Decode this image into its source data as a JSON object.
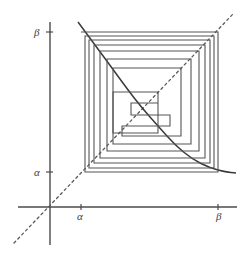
{
  "figure": {
    "type": "cobweb-plot",
    "labels": {
      "y_axis_upper": "β",
      "y_axis_lower": "α",
      "x_axis_lower": "α",
      "x_axis_upper": "β"
    },
    "colors": {
      "axis": "#4b4b4b",
      "curve": "#3a3a3a",
      "identity": "#5a5a5a",
      "cobweb": "#555555",
      "background": "#ffffff"
    }
  },
  "chart_data": {
    "type": "line",
    "title": "",
    "subtitle": "",
    "xlabel": "",
    "ylabel": "",
    "grid": false,
    "legend": "none",
    "xtick_labels": [
      "α",
      "β"
    ],
    "ytick_labels": [
      "α",
      "β"
    ],
    "xticks": [
      81,
      218
    ],
    "yticks": [
      172,
      32
    ],
    "xlim": [
      50,
      237
    ],
    "ylim": [
      207,
      22
    ],
    "origin": {
      "x": 50,
      "y": 207
    },
    "box": {
      "alpha_x": 81,
      "beta_x": 218,
      "alpha_y": 172,
      "beta_y": 32
    },
    "series": [
      {
        "name": "identity-line",
        "style": "dashed",
        "x": [
          14,
          233
        ],
        "y": [
          243,
          14
        ],
        "note": "line y = x through the origin"
      },
      {
        "name": "function-curve",
        "style": "solid",
        "note": "strictly decreasing map f from [alpha,beta] onto [alpha,beta]",
        "x": [
          78,
          95,
          112,
          128,
          142,
          158,
          175,
          192,
          210,
          226,
          236
        ],
        "y": [
          22,
          45,
          68,
          90,
          108,
          126,
          145,
          159,
          168,
          172,
          173
        ]
      },
      {
        "name": "cobweb-spiral",
        "style": "solid",
        "note": "staircase/cobweb orbit spiralling inward toward the fixed point",
        "vertices_x": [
          81,
          218,
          218,
          85,
          85,
          214,
          214,
          89,
          89,
          210,
          210,
          94,
          94,
          205,
          205,
          100,
          100,
          199,
          199,
          107,
          107,
          191,
          191,
          113,
          113,
          181,
          181,
          122,
          122,
          170,
          170,
          131,
          131,
          158
        ],
        "vertices_y": [
          32,
          32,
          172,
          172,
          36,
          36,
          168,
          168,
          40,
          40,
          163,
          163,
          45,
          45,
          158,
          158,
          51,
          51,
          151,
          151,
          59,
          59,
          144,
          144,
          68,
          68,
          136,
          136,
          126,
          126,
          115,
          115,
          103,
          103
        ]
      }
    ]
  }
}
